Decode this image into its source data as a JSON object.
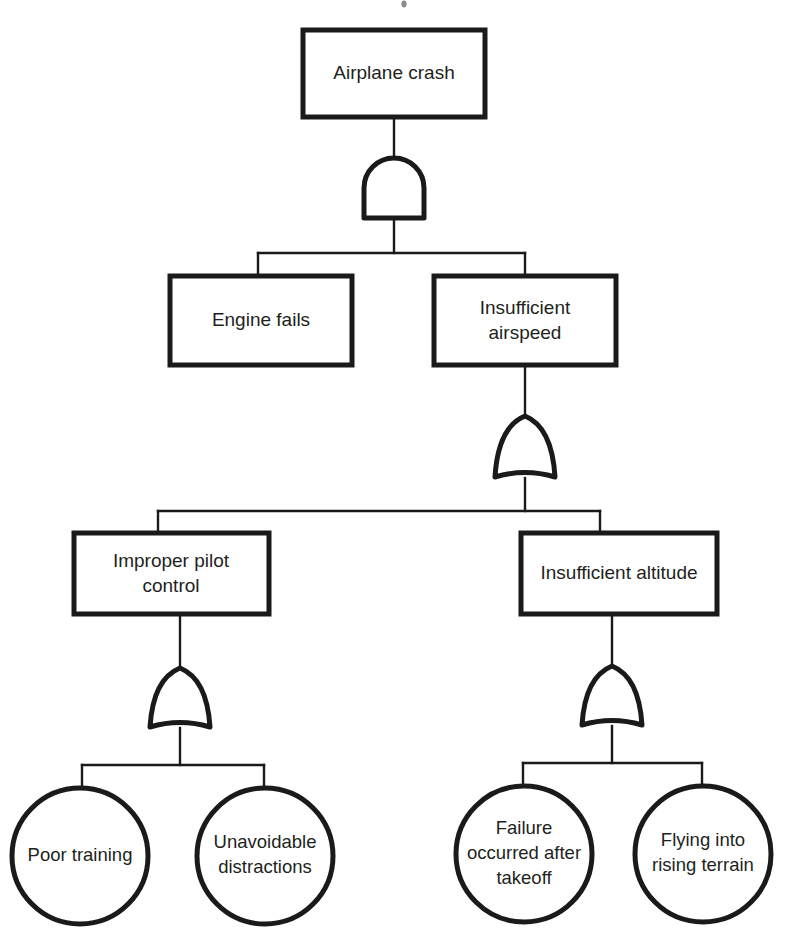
{
  "diagram": {
    "type": "fault-tree",
    "colors": {
      "stroke": "#1a1a1a",
      "text": "#231f20",
      "background": "#ffffff"
    },
    "nodes": {
      "top_event": {
        "id": "airplane-crash",
        "shape": "rectangle",
        "label": "Airplane crash",
        "lines": [
          "Airplane crash"
        ]
      },
      "engine_fails": {
        "id": "engine-fails",
        "shape": "rectangle",
        "label": "Engine fails",
        "lines": [
          "Engine fails"
        ]
      },
      "insufficient_airspeed": {
        "id": "insufficient-airspeed",
        "shape": "rectangle",
        "label": "Insufficient airspeed",
        "lines": [
          "Insufficient",
          "airspeed"
        ]
      },
      "improper_pilot_control": {
        "id": "improper-pilot-control",
        "shape": "rectangle",
        "label": "Improper pilot control",
        "lines": [
          "Improper pilot",
          "control"
        ]
      },
      "insufficient_altitude": {
        "id": "insufficient-altitude",
        "shape": "rectangle",
        "label": "Insufficient altitude",
        "lines": [
          "Insufficient altitude"
        ]
      },
      "poor_training": {
        "id": "poor-training",
        "shape": "circle",
        "label": "Poor training",
        "lines": [
          "Poor training"
        ]
      },
      "unavoidable_distractions": {
        "id": "unavoidable-distractions",
        "shape": "circle",
        "label": "Unavoidable distractions",
        "lines": [
          "Unavoidable",
          "distractions"
        ]
      },
      "failure_after_takeoff": {
        "id": "failure-occurred-after-takeoff",
        "shape": "circle",
        "label": "Failure occurred after takeoff",
        "lines": [
          "Failure",
          "occurred after",
          "takeoff"
        ]
      },
      "flying_into_rising_terrain": {
        "id": "flying-into-rising-terrain",
        "shape": "circle",
        "label": "Flying into rising terrain",
        "lines": [
          "Flying into",
          "rising terrain"
        ]
      }
    },
    "gates": {
      "gate_top": {
        "id": "and-gate-airplane-crash",
        "type": "AND",
        "output": "Airplane crash",
        "inputs": [
          "Engine fails",
          "Insufficient airspeed"
        ]
      },
      "gate_airspeed": {
        "id": "or-gate-insufficient-airspeed",
        "type": "OR",
        "output": "Insufficient airspeed",
        "inputs": [
          "Improper pilot control",
          "Insufficient altitude"
        ]
      },
      "gate_pilot": {
        "id": "or-gate-improper-pilot-control",
        "type": "OR",
        "output": "Improper pilot control",
        "inputs": [
          "Poor training",
          "Unavoidable distractions"
        ]
      },
      "gate_altitude": {
        "id": "or-gate-insufficient-altitude",
        "type": "OR",
        "output": "Insufficient altitude",
        "inputs": [
          "Failure occurred after takeoff",
          "Flying into rising terrain"
        ]
      }
    }
  }
}
